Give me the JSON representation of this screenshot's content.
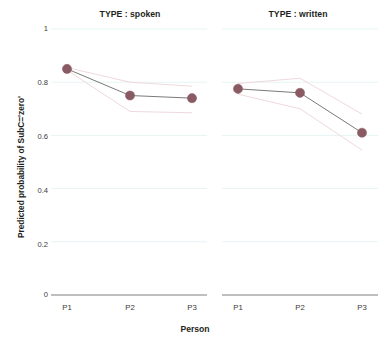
{
  "chart_data": {
    "type": "line",
    "title": "",
    "xlabel": "Person",
    "ylabel": "Predicted probability of SubC='zero'",
    "categories": [
      "P1",
      "P2",
      "P3"
    ],
    "x": [
      "P1",
      "P2",
      "P3"
    ],
    "ylim": [
      0,
      1
    ],
    "yticks": [
      "0",
      "0.2",
      "0.4",
      "0.6",
      "0.8",
      "1"
    ],
    "ytick_values": [
      0,
      0.2,
      0.4,
      0.6,
      0.8,
      1
    ],
    "grid": true,
    "legend": "none",
    "panel_variable": "TYPE",
    "panels": [
      {
        "label": "TYPE : spoken",
        "series": [
          {
            "name": "Predicted probability",
            "values": [
              0.85,
              0.75,
              0.74
            ],
            "ci_upper": [
              0.855,
              0.8,
              0.785
            ],
            "ci_lower": [
              0.845,
              0.69,
              0.685
            ]
          }
        ]
      },
      {
        "label": "TYPE : written",
        "series": [
          {
            "name": "Predicted probability",
            "values": [
              0.775,
              0.76,
              0.61
            ],
            "ci_upper": [
              0.795,
              0.815,
              0.68
            ],
            "ci_lower": [
              0.755,
              0.7,
              0.545
            ]
          }
        ]
      }
    ],
    "colors": {
      "marker": "#8a5a62",
      "line": "#7a7a7a",
      "ci_band": "#efd9dd",
      "gridline": "#e6f4f4",
      "axis": "#6f6f6f",
      "text": "#231f20",
      "background": "#ffffff"
    }
  },
  "axis": {
    "y_label": "Predicted probability of SubC='zero'",
    "x_label": "Person",
    "y_ticks": [
      "1",
      "0.8",
      "0.6",
      "0.4",
      "0.2",
      "0"
    ],
    "x_ticks": [
      "P1",
      "P2",
      "P3"
    ]
  },
  "panels": {
    "spoken_title": "TYPE : spoken",
    "written_title": "TYPE : written"
  }
}
